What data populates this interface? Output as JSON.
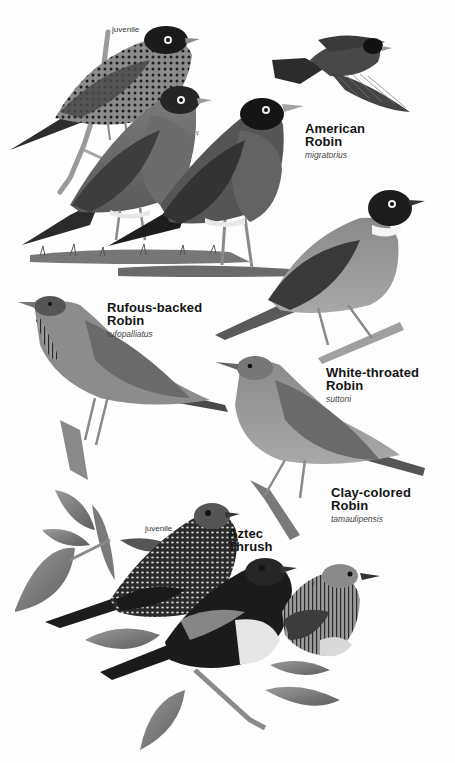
{
  "plate": {
    "background": "#fefefe",
    "species": [
      {
        "id": "american-robin",
        "common_name_line1": "American",
        "common_name_line2": "Robin",
        "scientific_name": "migratorius",
        "figures": [
          {
            "variant": "juvenile",
            "label": "juvenile"
          },
          {
            "variant": "female",
            "symbol": "♀"
          },
          {
            "variant": "male",
            "symbol": "♂"
          },
          {
            "variant": "flight"
          }
        ]
      },
      {
        "id": "rufous-backed-robin",
        "common_name_line1": "Rufous-backed",
        "common_name_line2": "Robin",
        "scientific_name": "rufopalliatus"
      },
      {
        "id": "white-throated-robin",
        "common_name_line1": "White-throated",
        "common_name_line2": "Robin",
        "scientific_name": "suttoni"
      },
      {
        "id": "clay-colored-robin",
        "common_name_line1": "Clay-colored",
        "common_name_line2": "Robin",
        "scientific_name": "tamaulipensis"
      },
      {
        "id": "aztec-thrush",
        "common_name_line1": "Aztec",
        "common_name_line2": "Thrush",
        "figures": [
          {
            "variant": "juvenile",
            "label": "juvenile"
          },
          {
            "variant": "male",
            "symbol": "♂"
          },
          {
            "variant": "female",
            "symbol": "♀"
          }
        ]
      }
    ]
  }
}
